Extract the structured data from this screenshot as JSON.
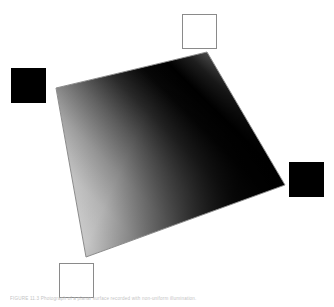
{
  "figure": {
    "canvas": {
      "width": 334,
      "height": 307,
      "background_color": "#ffffff"
    },
    "caption": {
      "text": "FIGURE 11.3   Photograph of a planar surface recorded with non-uniform illumination.",
      "color": "#b9b9b9",
      "font_size_px": 4.6
    },
    "quadrilateral": {
      "name": "gradient-quad",
      "outline_color": "#8a8a8a",
      "outline_width_px": 1,
      "corners": [
        {
          "label": "top-left",
          "x": 56,
          "y": 88
        },
        {
          "label": "top-right",
          "x": 207,
          "y": 52
        },
        {
          "label": "bottom-right",
          "x": 285,
          "y": 185
        },
        {
          "label": "bottom-left",
          "x": 86,
          "y": 257
        }
      ],
      "gradient": {
        "type": "linear",
        "direction_label": "bottom-left to top-right diagonal band",
        "x1": 95,
        "y1": 250,
        "x2": 250,
        "y2": 95,
        "stops": [
          {
            "offset": "0%",
            "color": "#f2f2f2"
          },
          {
            "offset": "16%",
            "color": "#d8d8d8"
          },
          {
            "offset": "32%",
            "color": "#a8a8a8"
          },
          {
            "offset": "48%",
            "color": "#6a6a6a"
          },
          {
            "offset": "62%",
            "color": "#2e2e2e"
          },
          {
            "offset": "74%",
            "color": "#080808"
          },
          {
            "offset": "84%",
            "color": "#000000"
          },
          {
            "offset": "93%",
            "color": "#2a2a2a"
          },
          {
            "offset": "100%",
            "color": "#6e6e6e"
          }
        ],
        "secondary": {
          "type": "linear",
          "direction_label": "darkening toward lower-right corner",
          "x1": 60,
          "y1": 90,
          "x2": 290,
          "y2": 195,
          "stops": [
            {
              "offset": "0%",
              "color": "rgba(0,0,0,0.00)"
            },
            {
              "offset": "35%",
              "color": "rgba(0,0,0,0.18)"
            },
            {
              "offset": "62%",
              "color": "rgba(0,0,0,0.55)"
            },
            {
              "offset": "80%",
              "color": "rgba(0,0,0,0.85)"
            },
            {
              "offset": "100%",
              "color": "rgba(0,0,0,0.97)"
            }
          ]
        }
      }
    },
    "markers": [
      {
        "name": "marker-top-white",
        "style": "outlined",
        "fill_color": "#ffffff",
        "stroke_color": "#8a8a8a",
        "x": 182,
        "y": 14,
        "width": 34,
        "height": 34
      },
      {
        "name": "marker-left-black",
        "style": "filled",
        "fill_color": "#000000",
        "stroke_color": "#000000",
        "x": 11,
        "y": 68,
        "width": 34,
        "height": 34
      },
      {
        "name": "marker-right-black",
        "style": "filled",
        "fill_color": "#000000",
        "stroke_color": "#000000",
        "x": 289,
        "y": 162,
        "width": 34,
        "height": 34
      },
      {
        "name": "marker-bottom-white",
        "style": "outlined",
        "fill_color": "#ffffff",
        "stroke_color": "#8a8a8a",
        "x": 59,
        "y": 263,
        "width": 34,
        "height": 34
      }
    ]
  }
}
